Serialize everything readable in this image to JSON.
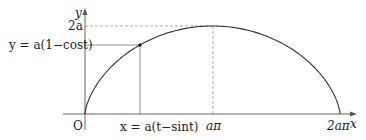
{
  "diagram": {
    "colors": {
      "curve": "#333333",
      "axis": "#555555",
      "guide": "#777777",
      "dashed": "#999999",
      "text": "#222222"
    },
    "axes": {
      "x_label": "x",
      "y_label": "y",
      "origin_label": "O"
    },
    "ticks": {
      "y_top": "2a",
      "x_mid": "aπ",
      "x_end": "2aπ"
    },
    "equations": {
      "y": "y = a(1−cost)",
      "x": "x = a(t−sint)"
    },
    "geometry": {
      "origin": [
        85,
        114
      ],
      "y_axis_top": 8,
      "x_axis_right": 356,
      "y_2a": 26,
      "x_api": 213,
      "x_2api": 340,
      "point": [
        140,
        45
      ]
    }
  }
}
